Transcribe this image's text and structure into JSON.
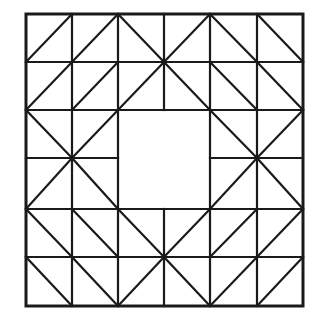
{
  "figure": {
    "name": "quilt-block-pattern",
    "background_color": "#ffffff",
    "line_color": "#1a1a1a",
    "border_width": 3,
    "grid_line_width": 2.2,
    "diagonal_line_width": 2.2
  },
  "canvas": {
    "width": 322,
    "height": 334
  },
  "geometry": {
    "grid_columns": 6,
    "grid_rows": 6,
    "x_coords": [
      26,
      72,
      118,
      164,
      210,
      257,
      303
    ],
    "y_coords": [
      14,
      62,
      110,
      158,
      209,
      257,
      306
    ],
    "cell_width": 46,
    "cell_height": 48.7,
    "center_square": {
      "x0": 118,
      "y0": 110,
      "x1": 210,
      "y1": 209
    }
  },
  "outer_border": {
    "x": 26,
    "y": 14,
    "width": 277,
    "height": 292
  },
  "grid_lines": {
    "vertical": [
      {
        "x": 72,
        "y0": 14,
        "y1": 306
      },
      {
        "x": 118,
        "y0": 14,
        "y1": 306
      },
      {
        "x": 164,
        "y0": 14,
        "y1": 306
      },
      {
        "x": 210,
        "y0": 14,
        "y1": 306
      },
      {
        "x": 257,
        "y0": 14,
        "y1": 306
      }
    ],
    "horizontal": [
      {
        "y": 62,
        "x0": 26,
        "x1": 303
      },
      {
        "y": 110,
        "x0": 26,
        "x1": 303
      },
      {
        "y": 158,
        "x0": 26,
        "x1": 303
      },
      {
        "y": 209,
        "x0": 26,
        "x1": 303
      },
      {
        "y": 257,
        "x0": 26,
        "x1": 303
      }
    ]
  },
  "suppressed_grid_segments": [
    {
      "orientation": "vertical",
      "x": 164,
      "y0": 110,
      "y1": 209
    },
    {
      "orientation": "horizontal",
      "y": 158,
      "x0": 118,
      "x1": 210
    }
  ],
  "diagonals": [
    {
      "cell": "r0c0",
      "dir": "anti",
      "x0": 26,
      "y0": 62,
      "x1": 72,
      "y1": 14
    },
    {
      "cell": "r0c1",
      "dir": "anti",
      "x0": 72,
      "y0": 62,
      "x1": 118,
      "y1": 14
    },
    {
      "cell": "r0c2",
      "dir": "main",
      "x0": 118,
      "y0": 14,
      "x1": 164,
      "y1": 62
    },
    {
      "cell": "r0c3",
      "dir": "anti",
      "x0": 164,
      "y0": 62,
      "x1": 210,
      "y1": 14
    },
    {
      "cell": "r0c4",
      "dir": "main",
      "x0": 210,
      "y0": 14,
      "x1": 257,
      "y1": 62
    },
    {
      "cell": "r0c5",
      "dir": "main",
      "x0": 257,
      "y0": 14,
      "x1": 303,
      "y1": 62
    },
    {
      "cell": "r1c0",
      "dir": "anti",
      "x0": 26,
      "y0": 110,
      "x1": 72,
      "y1": 62
    },
    {
      "cell": "r1c1",
      "dir": "anti",
      "x0": 72,
      "y0": 110,
      "x1": 118,
      "y1": 62
    },
    {
      "cell": "r1c2",
      "dir": "anti",
      "x0": 118,
      "y0": 110,
      "x1": 164,
      "y1": 62
    },
    {
      "cell": "r1c3",
      "dir": "main",
      "x0": 164,
      "y0": 62,
      "x1": 210,
      "y1": 110
    },
    {
      "cell": "r1c4",
      "dir": "main",
      "x0": 210,
      "y0": 62,
      "x1": 257,
      "y1": 110
    },
    {
      "cell": "r1c5",
      "dir": "main",
      "x0": 257,
      "y0": 62,
      "x1": 303,
      "y1": 110
    },
    {
      "cell": "r2c0",
      "dir": "main",
      "x0": 26,
      "y0": 110,
      "x1": 72,
      "y1": 158
    },
    {
      "cell": "r2c1",
      "dir": "anti",
      "x0": 72,
      "y0": 158,
      "x1": 118,
      "y1": 110
    },
    {
      "cell": "r2c4",
      "dir": "main",
      "x0": 210,
      "y0": 110,
      "x1": 257,
      "y1": 158
    },
    {
      "cell": "r2c5",
      "dir": "anti",
      "x0": 257,
      "y0": 158,
      "x1": 303,
      "y1": 110
    },
    {
      "cell": "r3c0",
      "dir": "anti",
      "x0": 26,
      "y0": 209,
      "x1": 72,
      "y1": 158
    },
    {
      "cell": "r3c1",
      "dir": "main",
      "x0": 72,
      "y0": 158,
      "x1": 118,
      "y1": 209
    },
    {
      "cell": "r3c4",
      "dir": "anti",
      "x0": 210,
      "y0": 209,
      "x1": 257,
      "y1": 158
    },
    {
      "cell": "r3c5",
      "dir": "main",
      "x0": 257,
      "y0": 158,
      "x1": 303,
      "y1": 209
    },
    {
      "cell": "r4c0",
      "dir": "main",
      "x0": 26,
      "y0": 209,
      "x1": 72,
      "y1": 257
    },
    {
      "cell": "r4c1",
      "dir": "main",
      "x0": 72,
      "y0": 209,
      "x1": 118,
      "y1": 257
    },
    {
      "cell": "r4c2",
      "dir": "main",
      "x0": 118,
      "y0": 209,
      "x1": 164,
      "y1": 257
    },
    {
      "cell": "r4c3",
      "dir": "anti",
      "x0": 164,
      "y0": 257,
      "x1": 210,
      "y1": 209
    },
    {
      "cell": "r4c4",
      "dir": "anti",
      "x0": 210,
      "y0": 257,
      "x1": 257,
      "y1": 209
    },
    {
      "cell": "r4c5",
      "dir": "anti",
      "x0": 257,
      "y0": 257,
      "x1": 303,
      "y1": 209
    },
    {
      "cell": "r5c0",
      "dir": "main",
      "x0": 26,
      "y0": 257,
      "x1": 72,
      "y1": 306
    },
    {
      "cell": "r5c1",
      "dir": "main",
      "x0": 72,
      "y0": 257,
      "x1": 118,
      "y1": 306
    },
    {
      "cell": "r5c2",
      "dir": "anti",
      "x0": 118,
      "y0": 306,
      "x1": 164,
      "y1": 257
    },
    {
      "cell": "r5c3",
      "dir": "main",
      "x0": 164,
      "y0": 257,
      "x1": 210,
      "y1": 306
    },
    {
      "cell": "r5c4",
      "dir": "anti",
      "x0": 210,
      "y0": 306,
      "x1": 257,
      "y1": 257
    },
    {
      "cell": "r5c5",
      "dir": "anti",
      "x0": 257,
      "y0": 306,
      "x1": 303,
      "y1": 257
    }
  ],
  "star_points": [
    {
      "name": "top-star-point",
      "x": 164,
      "y": 62
    },
    {
      "name": "left-star-point",
      "x": 72,
      "y": 158
    },
    {
      "name": "right-star-point",
      "x": 257,
      "y": 158
    },
    {
      "name": "bottom-star-point",
      "x": 164,
      "y": 257
    }
  ]
}
